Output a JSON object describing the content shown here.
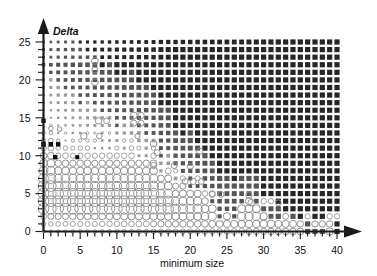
{
  "chart_data": {
    "type": "scatter",
    "title": "",
    "xlabel": "minimum size",
    "ylabel": "Delta",
    "xlim": [
      0,
      40
    ],
    "ylim": [
      0,
      25
    ],
    "grid": false,
    "legend": null,
    "x_ticks_major": [
      0,
      5,
      10,
      15,
      20,
      25,
      30,
      35,
      40
    ],
    "y_ticks_major": [
      0,
      5,
      10,
      15,
      20,
      25
    ],
    "x_tick_step_minor": 1,
    "y_tick_step_minor": 1,
    "x_tick_labels": [
      "0",
      "5",
      "10",
      "15",
      "20",
      "25",
      "30",
      "35",
      "40"
    ],
    "y_tick_labels": [
      "0",
      "5",
      "10",
      "15",
      "20",
      "25"
    ],
    "marker_encoding": {
      "hollow_marker": "open circle, grey outline",
      "filled_marker": "solid square-ish dot, dark grey to black",
      "size_means": "magnitude of value at grid cell",
      "fill_means": "sign / category of value at grid cell"
    },
    "colors": {
      "axis": "#1a1a1a",
      "text": "#111111",
      "hollow_stroke": "#8c8c8c",
      "filled_dark": "#262626",
      "filled_mid": "#555555",
      "filled_light": "#9a9a9a",
      "background": "#ffffff"
    },
    "notes": [
      "Bubble matrix: one marker per integer (minimum size, Delta) cell.",
      "Open circles concentrate in lower-left / lower band; filled dots dominate upper and right regions.",
      "Marker radius grows with distance from the hollow/filled transition boundary."
    ],
    "series": [
      {
        "name": "grid markers",
        "points": []
      }
    ]
  },
  "figure": {
    "alt": "Bubble matrix plot of Delta versus minimum size"
  }
}
